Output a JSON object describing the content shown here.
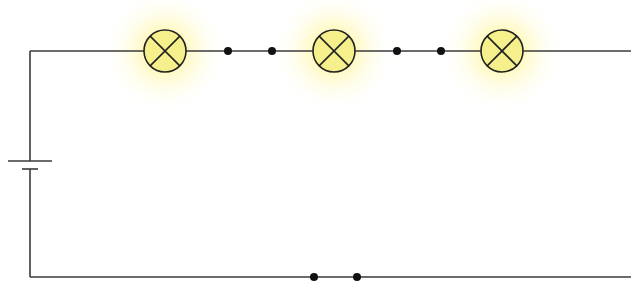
{
  "diagram": {
    "type": "series-circuit",
    "colors": {
      "wire": "#3a3a3a",
      "lamp_fill": "#f6f08c",
      "lamp_glow": "#fff25a",
      "terminal": "#111111",
      "background": "#ffffff"
    },
    "components": {
      "battery": {
        "label": "cell",
        "x": 30,
        "long_plate_y": 161,
        "short_plate_y": 169
      },
      "lamps": [
        {
          "id": "lamp-1",
          "cx": 165,
          "cy": 51,
          "r": 21,
          "state": "lit"
        },
        {
          "id": "lamp-2",
          "cx": 334,
          "cy": 51,
          "r": 21,
          "state": "lit"
        },
        {
          "id": "lamp-3",
          "cx": 502,
          "cy": 51,
          "r": 21,
          "state": "lit"
        }
      ],
      "terminal_pairs": [
        {
          "id": "gap-1",
          "points": [
            [
              228,
              51
            ],
            [
              272,
              51
            ]
          ]
        },
        {
          "id": "gap-2",
          "points": [
            [
              397,
              51
            ],
            [
              441,
              51
            ]
          ]
        },
        {
          "id": "gap-3",
          "points": [
            [
              314,
              277
            ],
            [
              357,
              277
            ]
          ]
        }
      ]
    }
  }
}
